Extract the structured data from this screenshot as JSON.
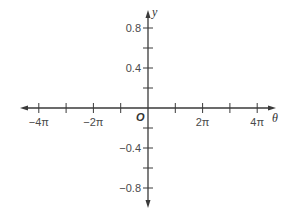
{
  "chart_data": {
    "type": "line",
    "title": "",
    "xlabel": "θ",
    "ylabel": "y",
    "origin_label": "O",
    "xlim": [
      -4.7,
      4.7
    ],
    "ylim": [
      -1.0,
      1.0
    ],
    "x_unit": "π",
    "x_ticks": [
      -4,
      -3,
      -2,
      -1,
      1,
      2,
      3,
      4
    ],
    "x_tick_labels": [
      {
        "value": -4,
        "label": "−4π"
      },
      {
        "value": -2,
        "label": "−2π"
      },
      {
        "value": 2,
        "label": "2π"
      },
      {
        "value": 4,
        "label": "4π"
      }
    ],
    "y_ticks": [
      -0.8,
      -0.6,
      -0.4,
      -0.2,
      0.2,
      0.4,
      0.6,
      0.8
    ],
    "y_tick_labels": [
      {
        "value": 0.8,
        "label": "0.8"
      },
      {
        "value": 0.4,
        "label": "0.4"
      },
      {
        "value": -0.4,
        "label": "−0.4"
      },
      {
        "value": -0.8,
        "label": "−0.8"
      }
    ],
    "grid": false,
    "series": []
  },
  "layout": {
    "origin_px": [
      148,
      108
    ],
    "px_per_pi": 27.3,
    "px_per_unit_y": 100,
    "x_axis_left": 20,
    "x_axis_right": 276,
    "y_axis_top": 10,
    "y_axis_bottom": 208,
    "axis_color": "#3a3a3a"
  }
}
